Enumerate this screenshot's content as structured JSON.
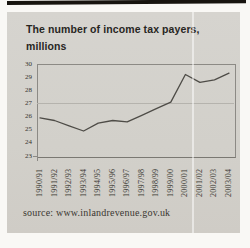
{
  "header": {
    "title_line1": "The number of income tax payers,",
    "title_line2": "millions"
  },
  "footer": {
    "source": "source: www.inlandrevenue.gov.uk"
  },
  "colors": {
    "top_rule": "#17140f",
    "panel_bg": "#d3d1cb",
    "series_line": "#4e4c47",
    "plot_frame": "#8c8a85",
    "gridline": "#b5b3ad"
  },
  "chart_data": {
    "type": "line",
    "title": "The number of income tax payers, millions",
    "categories": [
      "1990/91",
      "1991/92",
      "1992/93",
      "1993/94",
      "1994/95",
      "1995/96",
      "1996/97",
      "1997/98",
      "1998/99",
      "1999/00",
      "2000/01",
      "2001/02",
      "2002/03",
      "2003/04"
    ],
    "values": [
      25.9,
      25.7,
      25.3,
      24.9,
      25.5,
      25.7,
      25.6,
      26.1,
      26.6,
      27.1,
      29.2,
      28.6,
      28.8,
      29.3
    ],
    "ylim": [
      23,
      30
    ],
    "yticks": [
      30,
      29,
      28,
      27,
      26,
      25,
      24,
      23
    ],
    "gridline_at": 27,
    "xlabel": "",
    "ylabel": "",
    "x_tick_rotation": -90,
    "legend": "none",
    "source": "source: www.inlandrevenue.gov.uk"
  }
}
